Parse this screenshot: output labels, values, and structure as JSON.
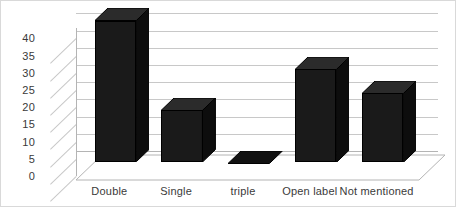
{
  "chart_data": {
    "type": "bar",
    "title": "",
    "subtitle": "",
    "xlabel": "",
    "ylabel": "",
    "categories": [
      "Double",
      "Single",
      "triple",
      "Open label",
      "Not mentioned"
    ],
    "values": [
      41,
      15,
      0,
      27,
      20
    ],
    "series": [
      {
        "name": "Count",
        "values": [
          41,
          15,
          0,
          27,
          20
        ]
      }
    ],
    "yticks": [
      0,
      5,
      10,
      15,
      20,
      25,
      30,
      35,
      40
    ],
    "ylim": [
      0,
      43
    ],
    "grid": true,
    "legend": false,
    "legend_position": "none",
    "style": "3d-column",
    "bar_color": "#1a1a1a",
    "grid_color": "#c8c8c8",
    "background_color": "#ffffff",
    "border_color": "#d9d9d9",
    "text_color": "#3a3a3a"
  },
  "axis": {
    "y_tick_labels": [
      "40",
      "35",
      "30",
      "25",
      "20",
      "15",
      "10",
      "5",
      "0"
    ]
  }
}
